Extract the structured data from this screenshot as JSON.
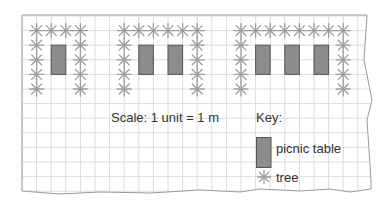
{
  "diagram": {
    "type": "grid-plan",
    "grid": {
      "origin_x": 22,
      "origin_y": 16,
      "cell_px": 14.6,
      "line_color": "#dcdcdc",
      "border_color": "#9a9a9a"
    },
    "colors": {
      "table_fill": "#8c8c8c",
      "table_stroke": "#555555",
      "tree": "#9c9c9c",
      "text": "#333333"
    },
    "groups": [
      {
        "name": "group-1",
        "trees": [
          [
            1,
            1
          ],
          [
            2,
            1
          ],
          [
            3,
            1
          ],
          [
            4,
            1
          ],
          [
            1,
            2
          ],
          [
            1,
            3
          ],
          [
            1,
            4
          ],
          [
            1,
            5
          ],
          [
            4,
            2
          ],
          [
            4,
            3
          ],
          [
            4,
            4
          ],
          [
            4,
            5
          ]
        ],
        "tables": [
          [
            2,
            2
          ]
        ]
      },
      {
        "name": "group-2",
        "trees": [
          [
            7,
            1
          ],
          [
            8,
            1
          ],
          [
            9,
            1
          ],
          [
            10,
            1
          ],
          [
            11,
            1
          ],
          [
            12,
            1
          ],
          [
            7,
            2
          ],
          [
            7,
            3
          ],
          [
            7,
            4
          ],
          [
            7,
            5
          ],
          [
            12,
            2
          ],
          [
            12,
            3
          ],
          [
            12,
            4
          ],
          [
            12,
            5
          ]
        ],
        "tables": [
          [
            8,
            2
          ],
          [
            10,
            2
          ]
        ]
      },
      {
        "name": "group-3",
        "trees": [
          [
            15,
            1
          ],
          [
            16,
            1
          ],
          [
            17,
            1
          ],
          [
            18,
            1
          ],
          [
            19,
            1
          ],
          [
            20,
            1
          ],
          [
            21,
            1
          ],
          [
            22,
            1
          ],
          [
            15,
            2
          ],
          [
            15,
            3
          ],
          [
            15,
            4
          ],
          [
            15,
            5
          ],
          [
            22,
            2
          ],
          [
            22,
            3
          ],
          [
            22,
            4
          ],
          [
            22,
            5
          ]
        ],
        "tables": [
          [
            16,
            2
          ],
          [
            18,
            2
          ],
          [
            20,
            2
          ]
        ]
      }
    ],
    "scale_text": "Scale: 1 unit = 1 m",
    "key": {
      "title": "Key:",
      "items": [
        {
          "icon": "picnic-table-icon",
          "label": "picnic table"
        },
        {
          "icon": "tree-icon",
          "label": "tree"
        }
      ]
    }
  }
}
